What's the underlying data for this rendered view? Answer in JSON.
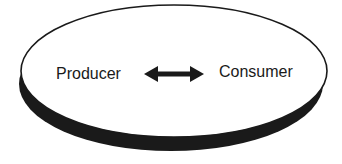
{
  "diagram": {
    "type": "producer-consumer relationship disc",
    "left_label": "Producer",
    "right_label": "Consumer",
    "connector": "bidirectional-arrow",
    "colors": {
      "background": "#ffffff",
      "disc_face": "#ffffff",
      "disc_edge": "#1a1a1a",
      "text": "#1a1a1a",
      "arrow": "#1a1a1a"
    }
  }
}
